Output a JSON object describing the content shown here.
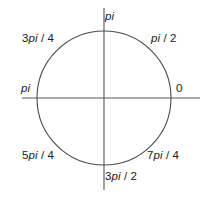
{
  "figure": {
    "background_color": "#ffffff",
    "line_color": "#555555",
    "circle_color": "#4a4a4a",
    "text_color": "#1a1a1a"
  },
  "labels": {
    "right": "0",
    "upper_right": "pi / 2",
    "top": "pi",
    "upper_left": "3pi / 4",
    "left": "pi",
    "lower_left": "5pi / 4",
    "bottom": "3pi / 2",
    "lower_right": "7pi / 4"
  },
  "chart_data": {
    "type": "scatter",
    "xlabel": "",
    "ylabel": "",
    "grid": false,
    "legend": null,
    "center": [
      104,
      98
    ],
    "radius": 67,
    "xlim": [
      -1,
      1
    ],
    "ylim": [
      -1,
      1
    ],
    "axes": {
      "horizontal": {
        "x1": 22,
        "y1": 98,
        "x2": 200,
        "y2": 98
      },
      "vertical": {
        "x1": 104,
        "y1": 8,
        "x2": 104,
        "y2": 190
      }
    },
    "points": [
      {
        "label": "0",
        "angle_deg": 0,
        "position": "right",
        "x": 1,
        "y": 0
      },
      {
        "label": "pi / 2",
        "angle_deg": 45,
        "position": "upper-right",
        "x": 0.707,
        "y": 0.707
      },
      {
        "label": "3pi / 4",
        "angle_deg": 135,
        "position": "upper-left",
        "x": -0.707,
        "y": 0.707
      },
      {
        "label": "pi",
        "angle_deg": 90,
        "position": "top",
        "x": 0,
        "y": 1
      },
      {
        "label": "pi",
        "angle_deg": 180,
        "position": "left",
        "x": -1,
        "y": 0
      },
      {
        "label": "5pi / 4",
        "angle_deg": 225,
        "position": "lower-left",
        "x": -0.707,
        "y": -0.707
      },
      {
        "label": "3pi / 2",
        "angle_deg": 270,
        "position": "bottom",
        "x": 0,
        "y": -1
      },
      {
        "label": "7pi / 4",
        "angle_deg": 315,
        "position": "lower-right",
        "x": 0.707,
        "y": -0.707
      }
    ]
  }
}
